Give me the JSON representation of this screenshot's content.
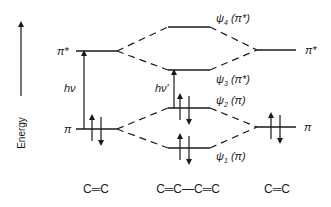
{
  "diagram": {
    "type": "molecular-orbital-energy-diagram",
    "axis": {
      "label": "Energy",
      "direction": "up"
    },
    "left_molecule": {
      "formula": "C═C",
      "levels": [
        {
          "name": "pi-star",
          "label": "π*",
          "electrons": 0
        },
        {
          "name": "pi",
          "label": "π",
          "electrons": 2
        }
      ],
      "transition_label": "hν"
    },
    "center_molecule": {
      "formula": "C═C—C═C",
      "levels": [
        {
          "name": "psi4",
          "psi": "ψ",
          "index": "4",
          "label": "(π*)",
          "electrons": 0
        },
        {
          "name": "psi3",
          "psi": "ψ",
          "index": "3",
          "label": "(π*)",
          "electrons": 0
        },
        {
          "name": "psi2",
          "psi": "ψ",
          "index": "2",
          "label": "(π)",
          "electrons": 2
        },
        {
          "name": "psi1",
          "psi": "ψ",
          "index": "1",
          "label": "(π)",
          "electrons": 2
        }
      ],
      "transition_label": "hν′"
    },
    "right_molecule": {
      "formula": "C═C",
      "levels": [
        {
          "name": "pi-star",
          "label": "π*",
          "electrons": 0
        },
        {
          "name": "pi",
          "label": "π",
          "electrons": 2
        }
      ]
    }
  }
}
